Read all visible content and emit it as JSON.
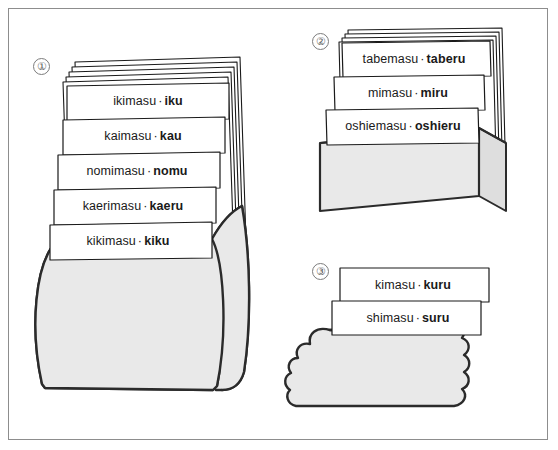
{
  "figure": {
    "frame_color": "#8d8d8d",
    "card_fill": "#ffffff",
    "card_stroke": "#1a1a1a",
    "container_fill": "#e9e9e9",
    "container_stroke": "#2b2b2b",
    "text_color": "#1a1a1a",
    "separator": "·"
  },
  "groups": [
    {
      "number": "①",
      "number_plain": "1",
      "container_shape": "barrel-pot",
      "blank_card_count": 5,
      "cards": [
        {
          "masu": "ikimasu",
          "dict": "iku"
        },
        {
          "masu": "kaimasu",
          "dict": "kau"
        },
        {
          "masu": "nomimasu",
          "dict": "nomu"
        },
        {
          "masu": "kaerimasu",
          "dict": "kaeru"
        },
        {
          "masu": "kikimasu",
          "dict": "kiku"
        }
      ]
    },
    {
      "number": "②",
      "number_plain": "2",
      "container_shape": "rectangular-box",
      "blank_card_count": 4,
      "cards": [
        {
          "masu": "tabemasu",
          "dict": "taberu"
        },
        {
          "masu": "mimasu",
          "dict": "miru"
        },
        {
          "masu": "oshiemasu",
          "dict": "oshieru"
        }
      ]
    },
    {
      "number": "③",
      "number_plain": "3",
      "container_shape": "scalloped-cloud",
      "blank_card_count": 0,
      "cards": [
        {
          "masu": "kimasu",
          "dict": "kuru"
        },
        {
          "masu": "shimasu",
          "dict": "suru"
        }
      ]
    }
  ],
  "labels": {
    "g1": [
      {
        "masu": "ikimasu",
        "dict": "iku",
        "x": 148,
        "y": 101
      },
      {
        "masu": "kaimasu",
        "dict": "kau",
        "x": 143,
        "y": 136
      },
      {
        "masu": "nomimasu",
        "dict": "nomu",
        "x": 137,
        "y": 171
      },
      {
        "masu": "kaerimasu",
        "dict": "kaeru",
        "x": 133,
        "y": 206
      },
      {
        "masu": "kikimasu",
        "dict": "kiku",
        "x": 128,
        "y": 241
      }
    ],
    "g2": [
      {
        "masu": "tabemasu",
        "dict": "taberu",
        "x": 414,
        "y": 59
      },
      {
        "masu": "mimasu",
        "dict": "miru",
        "x": 408,
        "y": 93
      },
      {
        "masu": "oshiemasu",
        "dict": "oshieru",
        "x": 403,
        "y": 126
      }
    ],
    "g3": [
      {
        "masu": "kimasu",
        "dict": "kuru",
        "x": 413,
        "y": 285
      },
      {
        "masu": "shimasu",
        "dict": "suru",
        "x": 408,
        "y": 318
      }
    ]
  },
  "group_markers": [
    {
      "label": "①",
      "x": 33,
      "y": 58
    },
    {
      "label": "②",
      "x": 312,
      "y": 33
    },
    {
      "label": "③",
      "x": 312,
      "y": 263
    }
  ]
}
